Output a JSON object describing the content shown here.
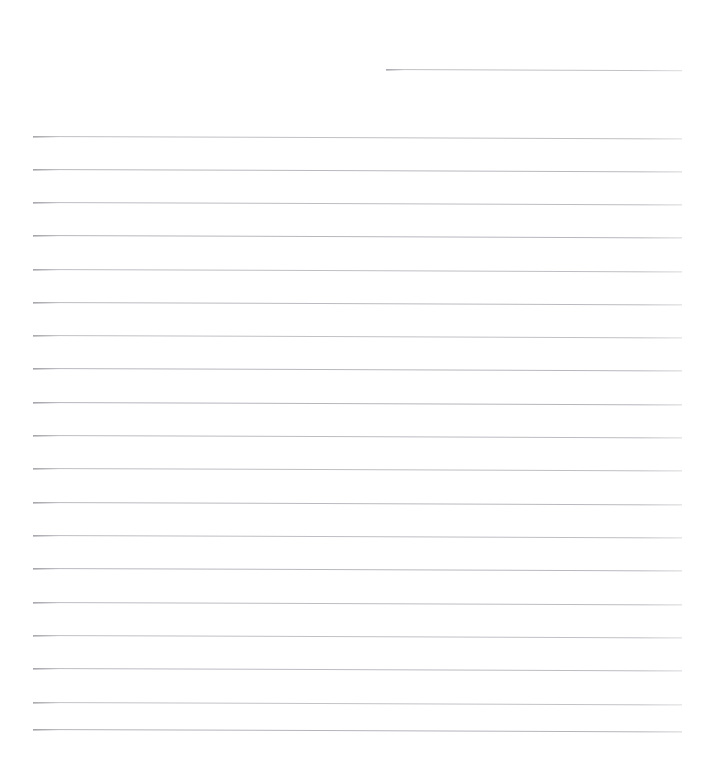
{
  "document": {
    "kind": "scanned-lined-paper",
    "title": "Blank Lined Paper Scan",
    "page_width": 714,
    "page_height": 767,
    "background_color": "#ffffff",
    "rule_color": "#bdbdc2",
    "rule_color_dark": "#a9a9b0",
    "rule_thickness_px": 1,
    "rule_spacing_px": 33.2,
    "skew_degrees": 0.22,
    "body_text": "",
    "written_content": ""
  },
  "rules": [
    {
      "name": "rule-header",
      "x": 386,
      "y": 69,
      "width": 296,
      "color": "#c2c2c7",
      "short": true
    },
    {
      "name": "rule-1",
      "x": 33,
      "y": 136,
      "width": 649,
      "color": "#c0c0c5",
      "short": false
    },
    {
      "name": "rule-2",
      "x": 33,
      "y": 169,
      "width": 649,
      "color": "#b9b9bf",
      "short": false
    },
    {
      "name": "rule-3",
      "x": 33,
      "y": 202,
      "width": 649,
      "color": "#bdbdc3",
      "short": false
    },
    {
      "name": "rule-4",
      "x": 33,
      "y": 235,
      "width": 649,
      "color": "#b7b7be",
      "short": false
    },
    {
      "name": "rule-5",
      "x": 33,
      "y": 269,
      "width": 649,
      "color": "#bfbfc5",
      "short": false
    },
    {
      "name": "rule-6",
      "x": 33,
      "y": 302,
      "width": 649,
      "color": "#bbbbc1",
      "short": false
    },
    {
      "name": "rule-7",
      "x": 33,
      "y": 335,
      "width": 649,
      "color": "#c1c1c6",
      "short": false
    },
    {
      "name": "rule-8",
      "x": 33,
      "y": 368,
      "width": 649,
      "color": "#b8b8bf",
      "short": false
    },
    {
      "name": "rule-9",
      "x": 33,
      "y": 402,
      "width": 649,
      "color": "#b6b6bd",
      "short": false
    },
    {
      "name": "rule-10",
      "x": 33,
      "y": 435,
      "width": 649,
      "color": "#bcbcc2",
      "short": false
    },
    {
      "name": "rule-11",
      "x": 33,
      "y": 468,
      "width": 649,
      "color": "#bfbfc4",
      "short": false
    },
    {
      "name": "rule-12",
      "x": 33,
      "y": 502,
      "width": 649,
      "color": "#babac0",
      "short": false
    },
    {
      "name": "rule-13",
      "x": 33,
      "y": 535,
      "width": 649,
      "color": "#bebec4",
      "short": false
    },
    {
      "name": "rule-14",
      "x": 33,
      "y": 568,
      "width": 649,
      "color": "#b9b9c0",
      "short": false
    },
    {
      "name": "rule-15",
      "x": 33,
      "y": 602,
      "width": 649,
      "color": "#bdbdc3",
      "short": false
    },
    {
      "name": "rule-16",
      "x": 33,
      "y": 635,
      "width": 649,
      "color": "#c0c0c6",
      "short": false
    },
    {
      "name": "rule-17",
      "x": 33,
      "y": 668,
      "width": 649,
      "color": "#bcbcc3",
      "short": false
    },
    {
      "name": "rule-18",
      "x": 33,
      "y": 702,
      "width": 649,
      "color": "#c3c3c8",
      "short": false
    },
    {
      "name": "rule-19",
      "x": 33,
      "y": 729,
      "width": 649,
      "color": "#b5b5bc",
      "short": false
    }
  ]
}
